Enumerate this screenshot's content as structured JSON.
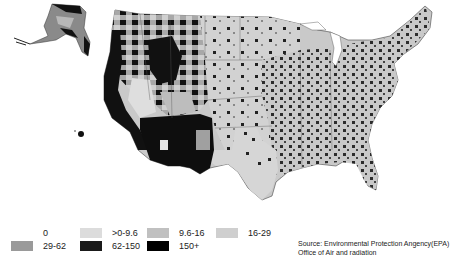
{
  "map": {
    "subject": "United States county map (EPA air data)",
    "regions_visible": [
      "Contiguous United States",
      "Alaska",
      "Hawaii"
    ],
    "colors": {
      "background": "#ffffff",
      "land_base": "#c8c8c8",
      "border": "#555555"
    }
  },
  "legend": {
    "items": [
      {
        "label": "0",
        "color": "#ffffff"
      },
      {
        "label": ">0-9.6",
        "color": "#dcdcdc"
      },
      {
        "label": "9.6-16",
        "color": "#c0c0c0"
      },
      {
        "label": "16-29",
        "color": "#cfcfcf"
      },
      {
        "label": "29-62",
        "color": "#9a9a9a"
      },
      {
        "label": "62-150",
        "color": "#1a1a1a"
      },
      {
        "label": "150+",
        "color": "#000000"
      }
    ]
  },
  "source": {
    "line1": "Source: Environmental Protection Angency(EPA)",
    "line2": "Office of Air and radiation"
  }
}
